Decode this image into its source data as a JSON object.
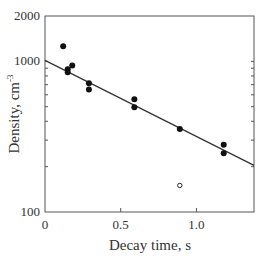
{
  "chart_data": {
    "type": "scatter",
    "title": "",
    "xlabel": "Decay time, s",
    "ylabel": "Density, cm",
    "ylabel_superscript": "-3",
    "xlim": [
      0,
      1.38
    ],
    "ylim": [
      100,
      2000
    ],
    "yscale": "log",
    "grid": false,
    "x_ticks": [
      {
        "value": 0,
        "label": "0"
      },
      {
        "value": 0.5,
        "label": "0.5"
      },
      {
        "value": 1.0,
        "label": "1.0"
      }
    ],
    "y_ticks": [
      {
        "value": 100,
        "label": "100"
      },
      {
        "value": 1000,
        "label": "1000"
      },
      {
        "value": 2000,
        "label": "2000"
      }
    ],
    "series": [
      {
        "name": "measured",
        "marker": "filled-circle",
        "points": [
          [
            0.12,
            1260
          ],
          [
            0.15,
            885
          ],
          [
            0.15,
            845
          ],
          [
            0.18,
            940
          ],
          [
            0.29,
            715
          ],
          [
            0.29,
            650
          ],
          [
            0.59,
            560
          ],
          [
            0.59,
            495
          ],
          [
            0.89,
            355
          ],
          [
            1.18,
            280
          ],
          [
            1.18,
            245
          ]
        ]
      },
      {
        "name": "outlier",
        "marker": "open-circle",
        "points": [
          [
            0.89,
            150
          ]
        ]
      },
      {
        "name": "fit",
        "type": "line",
        "points": [
          [
            0,
            1015
          ],
          [
            1.38,
            204
          ]
        ]
      }
    ]
  }
}
